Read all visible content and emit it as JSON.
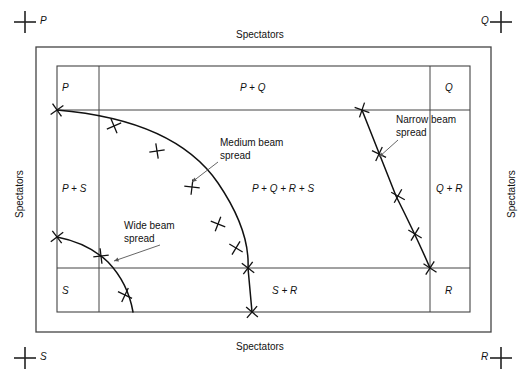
{
  "diagram": {
    "outer_frame": {
      "x": 36,
      "y": 47,
      "w": 455,
      "h": 285
    },
    "inner_box": {
      "x": 57,
      "y": 66,
      "w": 413,
      "h": 246
    },
    "dividers": {
      "v_left": 99,
      "v_right": 430,
      "h_top": 110,
      "h_bottom": 268
    },
    "stroke_color": "#444444",
    "curve_color": "#111111"
  },
  "corner_marks": [
    {
      "name": "corner-mark-p",
      "label": "P",
      "cx": 25,
      "cy": 22,
      "label_x": 40,
      "label_y": 15
    },
    {
      "name": "corner-mark-q",
      "label": "Q",
      "cx": 501,
      "cy": 22,
      "label_x": 481,
      "label_y": 15
    },
    {
      "name": "corner-mark-s",
      "label": "S",
      "cx": 25,
      "cy": 358,
      "label_x": 40,
      "label_y": 351
    },
    {
      "name": "corner-mark-r",
      "label": "R",
      "cx": 501,
      "cy": 358,
      "label_x": 481,
      "label_y": 351
    }
  ],
  "spectators": {
    "top": "Spectators",
    "bottom": "Spectators",
    "left": "Spectators",
    "right": "Spectators"
  },
  "zones": [
    {
      "name": "zone-p",
      "label": "P",
      "x": 62,
      "y": 82,
      "align": "left"
    },
    {
      "name": "zone-pq",
      "label": "P + Q",
      "x": 240,
      "y": 82,
      "align": "left"
    },
    {
      "name": "zone-q",
      "label": "Q",
      "x": 445,
      "y": 82,
      "align": "left"
    },
    {
      "name": "zone-ps",
      "label": "P + S",
      "x": 62,
      "y": 183,
      "align": "left"
    },
    {
      "name": "zone-pqrs",
      "label": "P + Q + R + S",
      "x": 252,
      "y": 183,
      "align": "left"
    },
    {
      "name": "zone-qr",
      "label": "Q + R",
      "x": 436,
      "y": 183,
      "align": "left"
    },
    {
      "name": "zone-s",
      "label": "S",
      "x": 62,
      "y": 285,
      "align": "left"
    },
    {
      "name": "zone-sr",
      "label": "S + R",
      "x": 272,
      "y": 285,
      "align": "left"
    },
    {
      "name": "zone-r",
      "label": "R",
      "x": 445,
      "y": 285,
      "align": "left"
    }
  ],
  "annotations": [
    {
      "name": "annotation-medium-beam",
      "line1": "Medium beam",
      "line2": "spread",
      "text_x": 220,
      "text_y": 136,
      "leader": {
        "x1": 218,
        "y1": 162,
        "x2": 192,
        "y2": 182
      }
    },
    {
      "name": "annotation-narrow-beam",
      "line1": "Narrow beam",
      "line2": "spread",
      "text_x": 396,
      "text_y": 113,
      "leader": {
        "x1": 398,
        "y1": 140,
        "x2": 379,
        "y2": 157
      }
    },
    {
      "name": "annotation-wide-beam",
      "line1": "Wide beam",
      "line2": "spread",
      "text_x": 124,
      "text_y": 219,
      "leader": {
        "x1": 160,
        "y1": 245,
        "x2": 114,
        "y2": 261
      }
    }
  ],
  "beams": [
    {
      "name": "beam-curve-medium",
      "label": "Medium beam spread",
      "path": "M 57 110 Q 175 120 218 183 Q 250 230 248 268 L 252 312",
      "markers": [
        {
          "x": 57,
          "y": 110,
          "angle": 10
        },
        {
          "x": 114,
          "y": 126,
          "angle": 22
        },
        {
          "x": 157,
          "y": 151,
          "angle": 36
        },
        {
          "x": 192,
          "y": 187,
          "angle": 52
        },
        {
          "x": 218,
          "y": 224,
          "angle": 66
        },
        {
          "x": 236,
          "y": 248,
          "angle": 76
        },
        {
          "x": 248,
          "y": 268,
          "angle": 82
        },
        {
          "x": 252,
          "y": 312,
          "angle": 86
        }
      ]
    },
    {
      "name": "beam-curve-narrow",
      "label": "Narrow beam spread",
      "path": "M 362 110 Q 378 150 396 196 Q 418 240 430 268",
      "markers": [
        {
          "x": 362,
          "y": 110,
          "angle": 64
        },
        {
          "x": 379,
          "y": 154,
          "angle": 70
        },
        {
          "x": 398,
          "y": 196,
          "angle": 74
        },
        {
          "x": 415,
          "y": 234,
          "angle": 76
        },
        {
          "x": 430,
          "y": 268,
          "angle": 78
        }
      ]
    },
    {
      "name": "beam-curve-wide",
      "label": "Wide beam spread",
      "path": "M 57 237 Q 88 243 108 262 Q 128 283 133 312",
      "markers": [
        {
          "x": 57,
          "y": 237,
          "angle": 8
        },
        {
          "x": 101,
          "y": 256,
          "angle": 38
        },
        {
          "x": 125,
          "y": 295,
          "angle": 70
        }
      ]
    }
  ]
}
